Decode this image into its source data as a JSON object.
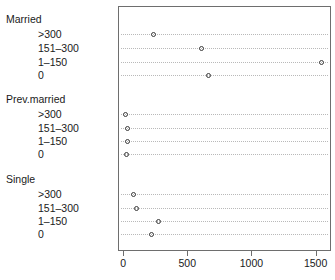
{
  "chart_data": {
    "type": "scatter",
    "plot_style": "cleveland-dotplot",
    "title": "",
    "xlabel": "",
    "ylabel": "",
    "xlim": [
      -40,
      1620
    ],
    "grid": "dotted-horizontal",
    "legend": "none",
    "marker": "open-circle",
    "xticks": [
      0,
      500,
      1000,
      1500
    ],
    "xticklabels": [
      "0",
      "500",
      "1000",
      "1500"
    ],
    "groups": [
      {
        "name": "Married",
        "categories": [
          ">300",
          "151–300",
          "1–150",
          "0"
        ],
        "values": [
          230,
          600,
          1540,
          660
        ]
      },
      {
        "name": "Prev.married",
        "categories": [
          ">300",
          "151–300",
          "1–150",
          "0"
        ],
        "values": [
          10,
          25,
          25,
          15
        ]
      },
      {
        "name": "Single",
        "categories": [
          ">300",
          "151–300",
          "1–150",
          "0"
        ],
        "values": [
          70,
          100,
          270,
          215
        ]
      }
    ]
  },
  "axis": {
    "ticks": [
      {
        "label": "0",
        "value": 0
      },
      {
        "label": "500",
        "value": 500
      },
      {
        "label": "1000",
        "value": 1000
      },
      {
        "label": "1500",
        "value": 1500
      }
    ]
  },
  "labels": {
    "married_group": "Married",
    "married_l1": ">300",
    "married_l2": "151–300",
    "married_l3": "1–150",
    "married_l4": "0",
    "prev_group": "Prev.married",
    "prev_l1": ">300",
    "prev_l2": "151–300",
    "prev_l3": "1–150",
    "prev_l4": "0",
    "single_group": "Single",
    "single_l1": ">300",
    "single_l2": "151–300",
    "single_l3": "1–150",
    "single_l4": "0"
  },
  "colors": {
    "frame": "#6e6e6e",
    "grid": "#b9b9b9",
    "marker": "#3a3a3a",
    "text": "#1a1a1a",
    "background": "#ffffff"
  }
}
